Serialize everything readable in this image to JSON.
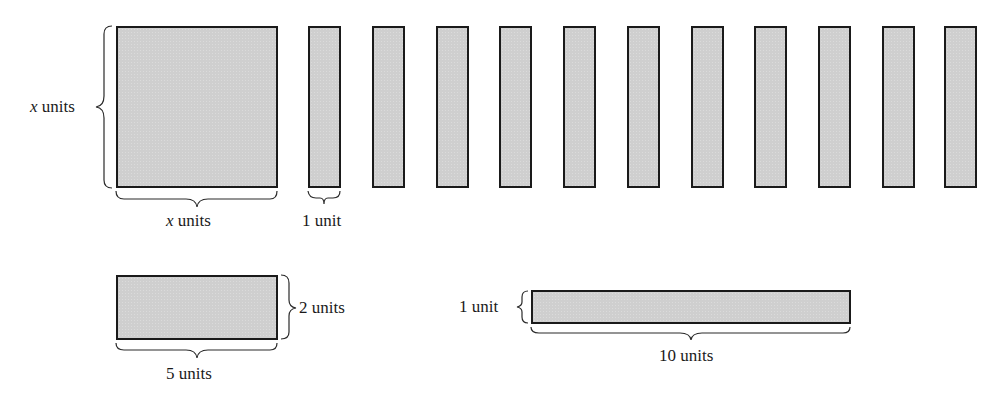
{
  "diagram": {
    "tiles": {
      "x_squared": {
        "name": "x-by-x square tile",
        "height_label_var": "x",
        "height_label_unit": "units",
        "width_label_var": "x",
        "width_label_unit": "units"
      },
      "x_strips": {
        "count": 11,
        "width_label": "1 unit"
      },
      "rect_2x5": {
        "height_label": "2 units",
        "width_label": "5 units"
      },
      "bar_1x10": {
        "height_label": "1 unit",
        "width_label": "10 units"
      }
    },
    "colors": {
      "tile_fill": "#cfcfcf",
      "tile_border": "#1a1a1a",
      "background": "#ffffff"
    }
  }
}
